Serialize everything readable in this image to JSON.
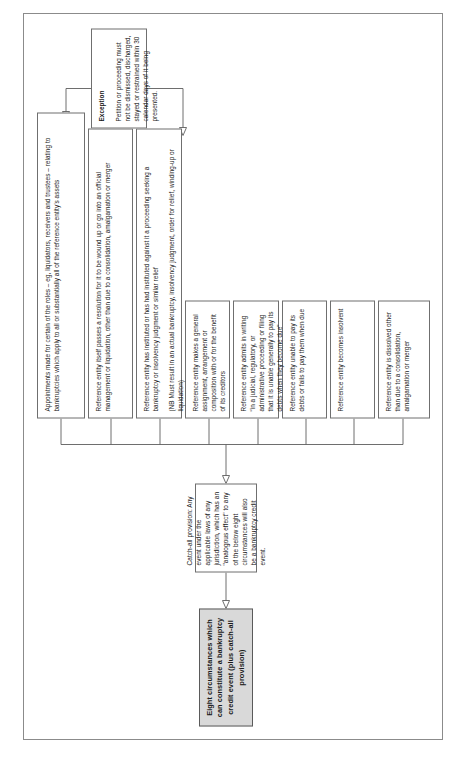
{
  "diagram": {
    "type": "flowchart",
    "orientation": "rotated-90-counterclockwise",
    "title": "Eight circumstances which can constitute a bankruptcy credit event (plus catch-all provision)",
    "catch_all": "Catch-all provision: Any event under the applicable laws of any jurisdiction, which has an \"analogous effect\" to any of the below eight circumstances will also be a bankruptcy credit event.",
    "circumstances": [
      {
        "index": 1,
        "text": "Reference entity is dissolved other than due to a consolidation, amalgamation or merger"
      },
      {
        "index": 2,
        "text": "Reference entity becomes insolvent"
      },
      {
        "index": 3,
        "text": "Reference entity unable to pay its debts or fails to pay them when due"
      },
      {
        "index": 4,
        "text": "Reference entity admits in writing “in a judicial, regulatory, or administrative proceeding or filing that it is unable generally to pay its debts when they become due”"
      },
      {
        "index": 5,
        "text": "Reference entity makes a general assignment, arrangement or composition with or for the benefit of its creditors"
      },
      {
        "index": 6,
        "text": "Reference entity has instituted or has had instituted against it a proceeding seeking a bankruptcy or insolvency judgment or similar relief",
        "note": "(NB Must result in an actual bankruptcy, insolvency judgment, order for relief, winding-up or liquidation)"
      },
      {
        "index": 7,
        "text": "Reference entity itself passes a resolution for it to be wound up or go into an official management or liquidation, other than due to a consolidation, amalgamation or merger"
      },
      {
        "index": 8,
        "text": "Appointments made for certain of the roles – eg, liquidators, receivers and trustees – relating to bankruptcies which apply to all or substantially all of the reference entity’s assets"
      }
    ],
    "exception": {
      "heading": "Exception",
      "text": "Petition or proceeding must not be dismissed, discharged, stayed or restrained within 30 calendar days of it being presented."
    }
  }
}
